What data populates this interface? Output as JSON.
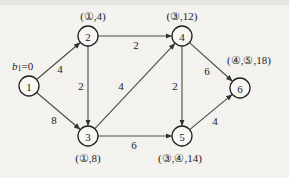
{
  "diagram": {
    "type": "directed-weighted-graph",
    "nodes": [
      {
        "id": "1",
        "label": "1",
        "x": 29,
        "y": 86,
        "annotation": "b₁=0",
        "ann_x": 12,
        "ann_y": 66,
        "ann_anchor": "start"
      },
      {
        "id": "2",
        "label": "2",
        "x": 88,
        "y": 36,
        "annotation": "(①,4)",
        "ann_x": 93,
        "ann_y": 16,
        "ann_anchor": "middle"
      },
      {
        "id": "3",
        "label": "3",
        "x": 88,
        "y": 136,
        "annotation": "(①,8)",
        "ann_x": 88,
        "ann_y": 158,
        "ann_anchor": "middle"
      },
      {
        "id": "4",
        "label": "4",
        "x": 182,
        "y": 36,
        "annotation": "(③,12)",
        "ann_x": 182,
        "ann_y": 16,
        "ann_anchor": "middle"
      },
      {
        "id": "5",
        "label": "5",
        "x": 182,
        "y": 136,
        "annotation": "(③,④,14)",
        "ann_x": 180,
        "ann_y": 158,
        "ann_anchor": "middle"
      },
      {
        "id": "6",
        "label": "6",
        "x": 240,
        "y": 88,
        "annotation": "(④,⑤,18)",
        "ann_x": 249,
        "ann_y": 60,
        "ann_anchor": "middle"
      }
    ],
    "edges": [
      {
        "from": "1",
        "to": "2",
        "weight": "4",
        "wx": 60,
        "wy": 69
      },
      {
        "from": "1",
        "to": "3",
        "weight": "8",
        "wx": 54,
        "wy": 120
      },
      {
        "from": "2",
        "to": "3",
        "weight": "2",
        "wx": 81,
        "wy": 86
      },
      {
        "from": "2",
        "to": "4",
        "weight": "2",
        "wx": 136,
        "wy": 45
      },
      {
        "from": "3",
        "to": "4",
        "weight": "4",
        "wx": 121,
        "wy": 86
      },
      {
        "from": "3",
        "to": "5",
        "weight": "6",
        "wx": 134,
        "wy": 145
      },
      {
        "from": "4",
        "to": "5",
        "weight": "2",
        "wx": 175,
        "wy": 86
      },
      {
        "from": "4",
        "to": "6",
        "weight": "6",
        "wx": 207,
        "wy": 71
      },
      {
        "from": "5",
        "to": "6",
        "weight": "4",
        "wx": 215,
        "wy": 121
      }
    ],
    "node_radius": 10,
    "colors": {
      "background": "#f3f2ef",
      "stroke": "#222222",
      "edge": "#4a4a4a"
    }
  }
}
